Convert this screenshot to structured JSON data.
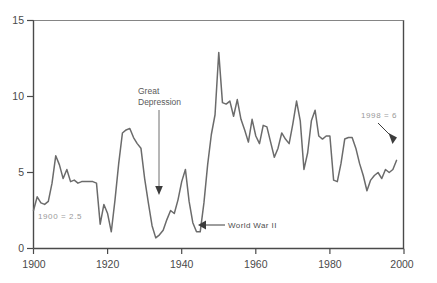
{
  "chart_data": {
    "type": "line",
    "title": "",
    "xlabel": "",
    "ylabel": "",
    "xlim": [
      1900,
      2000
    ],
    "ylim": [
      0,
      15
    ],
    "xticks": [
      "1900",
      "1920",
      "1940",
      "1960",
      "1980",
      "2000"
    ],
    "yticks": [
      "0",
      "5",
      "10",
      "15"
    ],
    "grid": false,
    "legend_position": "none",
    "line_color": "#6b6b6b",
    "series": [
      {
        "name": "value",
        "x": [
          1900,
          1901,
          1902,
          1903,
          1904,
          1905,
          1906,
          1907,
          1908,
          1909,
          1910,
          1911,
          1912,
          1913,
          1914,
          1915,
          1916,
          1917,
          1918,
          1919,
          1920,
          1921,
          1922,
          1923,
          1924,
          1925,
          1926,
          1927,
          1928,
          1929,
          1930,
          1931,
          1932,
          1933,
          1934,
          1935,
          1936,
          1937,
          1938,
          1939,
          1940,
          1941,
          1942,
          1943,
          1944,
          1945,
          1946,
          1947,
          1948,
          1949,
          1950,
          1951,
          1952,
          1953,
          1954,
          1955,
          1956,
          1957,
          1958,
          1959,
          1960,
          1961,
          1962,
          1963,
          1964,
          1965,
          1966,
          1967,
          1968,
          1969,
          1970,
          1971,
          1972,
          1973,
          1974,
          1975,
          1976,
          1977,
          1978,
          1979,
          1980,
          1981,
          1982,
          1983,
          1984,
          1985,
          1986,
          1987,
          1988,
          1989,
          1990,
          1991,
          1992,
          1993,
          1994,
          1995,
          1996,
          1997,
          1998
        ],
        "y": [
          2.5,
          3.4,
          3.0,
          2.9,
          3.1,
          4.3,
          6.1,
          5.5,
          4.6,
          5.2,
          4.4,
          4.5,
          4.3,
          4.4,
          4.4,
          4.4,
          4.4,
          4.3,
          1.6,
          2.9,
          2.3,
          1.1,
          3.2,
          5.6,
          7.6,
          7.8,
          7.9,
          7.3,
          6.9,
          6.6,
          4.6,
          3.0,
          1.5,
          0.7,
          0.9,
          1.2,
          1.9,
          2.5,
          2.3,
          3.2,
          4.4,
          5.2,
          3.1,
          1.7,
          1.1,
          1.1,
          3.0,
          5.5,
          7.5,
          8.8,
          12.9,
          9.6,
          9.5,
          9.7,
          8.7,
          9.8,
          8.5,
          7.8,
          7.0,
          8.5,
          7.4,
          6.9,
          8.1,
          8.0,
          7.0,
          6.0,
          6.6,
          7.6,
          7.2,
          6.9,
          8.2,
          9.7,
          8.4,
          5.2,
          6.3,
          8.4,
          9.1,
          7.4,
          7.2,
          7.4,
          7.4,
          4.5,
          4.4,
          5.6,
          7.2,
          7.3,
          7.3,
          6.6,
          5.6,
          4.8,
          3.8,
          4.5,
          4.8,
          5.0,
          4.6,
          5.2,
          5.0,
          5.2,
          5.8
        ]
      }
    ],
    "annotations": [
      {
        "name": "great-depression",
        "text_line1": "Great",
        "text_line2": "Depression",
        "kind": "pointer-down"
      },
      {
        "name": "world-war-two",
        "text": "World  War  II",
        "kind": "pointer-left"
      },
      {
        "name": "start-value",
        "text": "1900 = 2.5",
        "kind": "label"
      },
      {
        "name": "end-value",
        "text": "1998 = 6",
        "kind": "pointer-down-right"
      }
    ]
  }
}
